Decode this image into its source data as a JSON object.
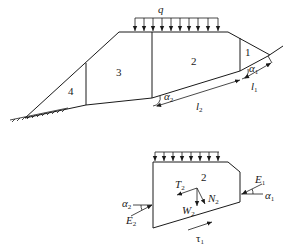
{
  "figure": {
    "top_diagram": {
      "load_label": "q",
      "blocks": [
        {
          "id": "1",
          "label": "1"
        },
        {
          "id": "2",
          "label": "2"
        },
        {
          "id": "3",
          "label": "3"
        },
        {
          "id": "4",
          "label": "4"
        }
      ],
      "angle_labels": {
        "alpha1": "α",
        "alpha1_sub": "1",
        "alpha2": "α",
        "alpha2_sub": "2"
      },
      "length_labels": {
        "l1": "l",
        "l1_sub": "1",
        "l2": "l",
        "l2_sub": "2"
      }
    },
    "bottom_diagram": {
      "block_label": "2",
      "forces": {
        "T2": {
          "main": "T",
          "sub": "2"
        },
        "W2": {
          "main": "W",
          "sub": "2"
        },
        "N2": {
          "main": "N",
          "sub": "2"
        },
        "E1": {
          "main": "E",
          "sub": "1"
        },
        "E2": {
          "main": "E",
          "sub": "2"
        },
        "tau1": {
          "main": "τ",
          "sub": "1"
        }
      },
      "angle_labels": {
        "alpha1": {
          "main": "α",
          "sub": "1"
        },
        "alpha2": {
          "main": "α",
          "sub": "2"
        }
      }
    },
    "colors": {
      "line": "#1a1a1a",
      "background": "#ffffff"
    }
  }
}
